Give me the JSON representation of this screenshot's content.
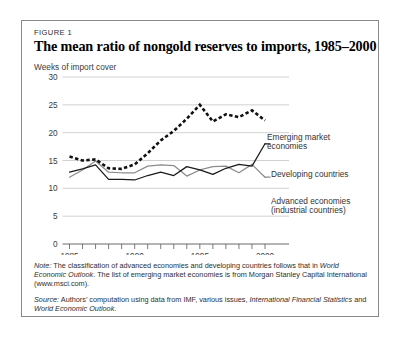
{
  "figure": {
    "label": "FIGURE 1",
    "title": "The mean ratio of nongold reserves to imports, 1985–2000",
    "axis_caption": "Weeks of import cover"
  },
  "legend": {
    "emerging_line1": "Emerging market",
    "emerging_line2": "economies",
    "developing": "Developing countries",
    "advanced_line1": "Advanced economies",
    "advanced_line2": "(industrial countries)"
  },
  "notes": {
    "note_lead": "Note:",
    "note_part1": " The classification of advanced economies and developing countries follows that in ",
    "note_italic1": "World Economic Outlook",
    "note_part2": ". The list of emerging market economies is from Morgan Stanley Capital International (www.msci.com).",
    "source_lead": "Source:",
    "source_part1": " Authors’ computation using data from IMF, various issues, ",
    "source_italic1": "International Financial Statistics",
    "source_part2": " and ",
    "source_italic2": "World Economic Outlook",
    "source_part3": "."
  },
  "colors": {
    "border": "#8a8a8a",
    "gridline": "#cccccc",
    "emerging": "#111111",
    "developing": "#1a1a1a",
    "advanced": "#8c8c8c",
    "axis": "#6b6b6b",
    "text": "#2e2e2e"
  },
  "chart_data": {
    "type": "line",
    "title": "The mean ratio of nongold reserves to imports, 1985–2000",
    "xlabel": "",
    "ylabel": "Weeks of import cover",
    "xlim": [
      1985,
      2000
    ],
    "ylim": [
      0,
      30
    ],
    "yticks": [
      0,
      5,
      10,
      15,
      20,
      25,
      30
    ],
    "xticks": [
      1985,
      1986,
      1987,
      1988,
      1989,
      1990,
      1991,
      1992,
      1993,
      1994,
      1995,
      1996,
      1997,
      1998,
      1999,
      2000
    ],
    "xtick_labels_shown": [
      "1985",
      "1990",
      "1995",
      "2000"
    ],
    "grid": "horizontal",
    "legend_position": "right-inline",
    "x": [
      1985,
      1986,
      1987,
      1988,
      1989,
      1990,
      1991,
      1992,
      1993,
      1994,
      1995,
      1996,
      1997,
      1998,
      1999,
      2000
    ],
    "series": [
      {
        "name": "Emerging market economies",
        "style": "dashed",
        "color": "#111111",
        "values": [
          15.7,
          15.0,
          15.2,
          13.6,
          13.5,
          14.3,
          16.3,
          18.6,
          20.3,
          22.5,
          25.0,
          22.0,
          23.3,
          22.8,
          24.0,
          22.2
        ]
      },
      {
        "name": "Developing countries",
        "style": "solid",
        "color": "#1a1a1a",
        "values": [
          12.9,
          13.5,
          14.2,
          11.6,
          11.6,
          11.5,
          12.3,
          12.9,
          12.3,
          13.9,
          13.3,
          12.5,
          13.6,
          14.3,
          14.0,
          18.0
        ]
      },
      {
        "name": "Advanced economies (industrial countries)",
        "style": "solid",
        "color": "#8c8c8c",
        "values": [
          12.0,
          13.3,
          14.9,
          12.9,
          12.8,
          12.8,
          14.0,
          14.2,
          14.1,
          12.2,
          13.3,
          13.9,
          14.0,
          12.8,
          14.3,
          12.0
        ]
      }
    ]
  }
}
